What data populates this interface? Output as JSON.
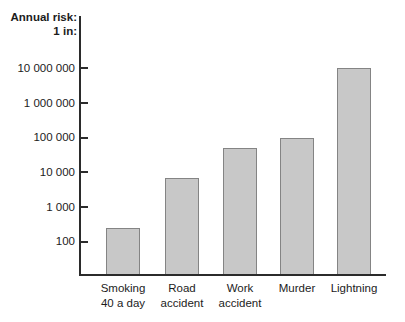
{
  "header": {
    "title_line1": "Annual risk:",
    "title_line2": "1 in:"
  },
  "chart_data": {
    "type": "bar",
    "title": "Annual risk: 1 in:",
    "scale": "log",
    "categories": [
      "Smoking 40 a day",
      "Road accident",
      "Work accident",
      "Murder",
      "Lightning"
    ],
    "category_label_lines": [
      [
        "Smoking",
        "40 a day"
      ],
      [
        "Road",
        "accident"
      ],
      [
        "Work",
        "accident"
      ],
      [
        "Murder"
      ],
      [
        "Lightning"
      ]
    ],
    "values": [
      250,
      7000,
      50000,
      100000,
      10000000
    ],
    "xlabel": "",
    "ylabel": "Annual risk: 1 in:",
    "yticks": [
      {
        "label": "10 000 000",
        "value": 10000000
      },
      {
        "label": "1 000 000",
        "value": 1000000
      },
      {
        "label": "100 000",
        "value": 100000
      },
      {
        "label": "10 000",
        "value": 10000
      },
      {
        "label": "1 000",
        "value": 1000
      },
      {
        "label": "100",
        "value": 100
      }
    ],
    "ylim": [
      100,
      10000000
    ],
    "grid": false,
    "legend": false,
    "colors": {
      "bar_fill": "#c8c8c8",
      "bar_border": "#848484",
      "axis": "#2b2b2b",
      "text": "#1c1c1c",
      "background": "#ffffff"
    }
  }
}
